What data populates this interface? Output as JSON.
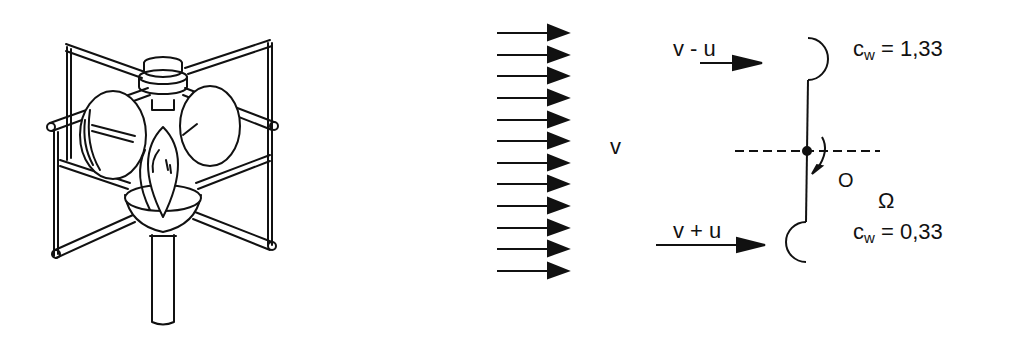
{
  "figure": {
    "left_panel": {
      "description": "Cup anemometer / Savonius-type rotor illustration with four cups on cross-frame arms and vertical shaft",
      "icon": "cup-rotor-drawing"
    },
    "middle_panel": {
      "arrow_count": 12,
      "icon": "flow-arrows",
      "velocity_label": "v"
    },
    "right_panel": {
      "top_flow_label": "v - u",
      "bottom_flow_label": "v + u",
      "top_cw": {
        "symbol": "c",
        "subscript": "w",
        "value": "= 1,33"
      },
      "bottom_cw": {
        "symbol": "c",
        "subscript": "w",
        "value": "= 0,33"
      },
      "center_label": "O",
      "rotation_label": "Ω"
    }
  }
}
